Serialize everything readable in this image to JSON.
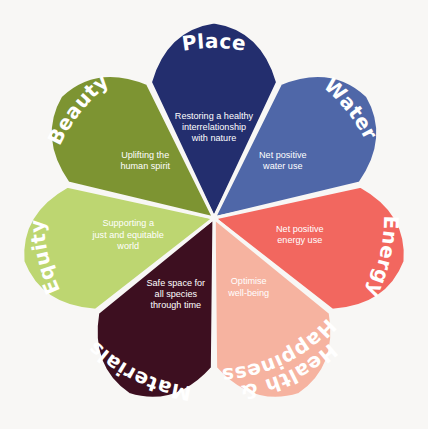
{
  "diagram": {
    "type": "petal-wheel",
    "background_color": "#f8f7f5",
    "divider_color": "#f8f7f5",
    "center": {
      "x": 214,
      "y": 218
    },
    "petal_count": 7,
    "petals": [
      {
        "id": "place",
        "title": "Place",
        "description": "Restoring a healthy interrelationship with nature",
        "description_lines": [
          "Restoring a healthy",
          "interrelationship",
          "with nature"
        ],
        "color": "#232e6e",
        "title_color": "#ffffff",
        "description_color": "#ffffff",
        "order": 1
      },
      {
        "id": "water",
        "title": "Water",
        "description": "Net positive water use",
        "description_lines": [
          "Net positive",
          "water use"
        ],
        "color": "#4f67a8",
        "title_color": "#ffffff",
        "description_color": "#ffffff",
        "order": 2
      },
      {
        "id": "energy",
        "title": "Energy",
        "description": "Net positive energy use",
        "description_lines": [
          "Net positive",
          "energy use"
        ],
        "color": "#f2675f",
        "title_color": "#ffffff",
        "description_color": "#ffffff",
        "order": 3
      },
      {
        "id": "health-happiness",
        "title": "Health & Happiness",
        "title_lines": [
          "Health &",
          "Happiness"
        ],
        "description": "Optimise well-being",
        "description_lines": [
          "Optimise",
          "well-being"
        ],
        "color": "#f6b3a0",
        "title_color": "#ffffff",
        "description_color": "#ffffff",
        "order": 4
      },
      {
        "id": "materials",
        "title": "Materials",
        "description": "Safe space for all species through time",
        "description_lines": [
          "Safe space for",
          "all species",
          "through time"
        ],
        "color": "#3d0f20",
        "title_color": "#ffffff",
        "description_color": "#ffffff",
        "order": 5
      },
      {
        "id": "equity",
        "title": "Equity",
        "description": "Supporting a just and equitable world",
        "description_lines": [
          "Supporting a",
          "just and equitable",
          "world"
        ],
        "color": "#bdd671",
        "title_color": "#ffffff",
        "description_color": "#ffffff",
        "order": 6
      },
      {
        "id": "beauty",
        "title": "Beauty",
        "description": "Uplifting the human spirit",
        "description_lines": [
          "Uplifting the",
          "human spirit"
        ],
        "color": "#7d9432",
        "title_color": "#ffffff",
        "description_color": "#ffffff",
        "order": 7
      }
    ]
  }
}
